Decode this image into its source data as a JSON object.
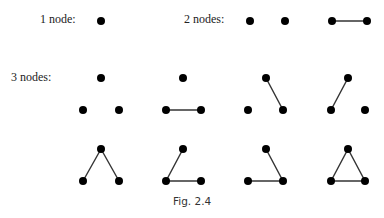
{
  "labels": {
    "one_node": "1 node:",
    "two_nodes": "2 nodes:",
    "three_nodes": "3 nodes:"
  },
  "caption": "Fig. 2.4",
  "colors": {
    "node": "#000000",
    "edge": "#333333"
  },
  "graphs": [
    {
      "group": "1 node",
      "nodes": [
        [
          101,
          21
        ]
      ],
      "edges": []
    },
    {
      "group": "2 nodes",
      "nodes": [
        [
          250,
          21
        ],
        [
          285,
          21
        ]
      ],
      "edges": []
    },
    {
      "group": "2 nodes",
      "nodes": [
        [
          332,
          21
        ],
        [
          367,
          21
        ]
      ],
      "edges": [
        [
          0,
          1
        ]
      ]
    },
    {
      "group": "3 nodes",
      "nodes": [
        [
          101,
          78
        ],
        [
          83,
          110
        ],
        [
          119,
          110
        ]
      ],
      "edges": []
    },
    {
      "group": "3 nodes",
      "nodes": [
        [
          183,
          78
        ],
        [
          166,
          110
        ],
        [
          201,
          110
        ]
      ],
      "edges": [
        [
          1,
          2
        ]
      ]
    },
    {
      "group": "3 nodes",
      "nodes": [
        [
          266,
          78
        ],
        [
          248,
          110
        ],
        [
          283,
          110
        ]
      ],
      "edges": [
        [
          0,
          2
        ]
      ]
    },
    {
      "group": "3 nodes",
      "nodes": [
        [
          348,
          78
        ],
        [
          331,
          110
        ],
        [
          365,
          110
        ]
      ],
      "edges": [
        [
          0,
          1
        ]
      ]
    },
    {
      "group": "3 nodes",
      "nodes": [
        [
          101,
          149
        ],
        [
          83,
          181
        ],
        [
          119,
          181
        ]
      ],
      "edges": [
        [
          0,
          1
        ],
        [
          0,
          2
        ]
      ]
    },
    {
      "group": "3 nodes",
      "nodes": [
        [
          183,
          149
        ],
        [
          166,
          181
        ],
        [
          201,
          181
        ]
      ],
      "edges": [
        [
          0,
          1
        ],
        [
          1,
          2
        ]
      ]
    },
    {
      "group": "3 nodes",
      "nodes": [
        [
          266,
          149
        ],
        [
          248,
          181
        ],
        [
          283,
          181
        ]
      ],
      "edges": [
        [
          0,
          2
        ],
        [
          1,
          2
        ]
      ]
    },
    {
      "group": "3 nodes",
      "nodes": [
        [
          348,
          149
        ],
        [
          331,
          181
        ],
        [
          365,
          181
        ]
      ],
      "edges": [
        [
          0,
          1
        ],
        [
          0,
          2
        ],
        [
          1,
          2
        ]
      ]
    }
  ]
}
